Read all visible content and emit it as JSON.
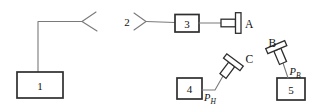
{
  "diagram": {
    "type": "ultrasonic-test-schematic",
    "background": "#ffffff",
    "colors": {
      "connector": "#7a7a7a",
      "outline": "#2e2e2e",
      "text": "#111111"
    },
    "nodes": {
      "block1": "1",
      "antenna2": "2",
      "block3": "3",
      "block4": "4",
      "block5": "5"
    },
    "transducers": {
      "a": "A",
      "b": "B",
      "c": "C"
    },
    "ports": {
      "ph": {
        "base": "P",
        "sub": "H"
      },
      "pb": {
        "base": "P",
        "sub": "B"
      }
    }
  }
}
